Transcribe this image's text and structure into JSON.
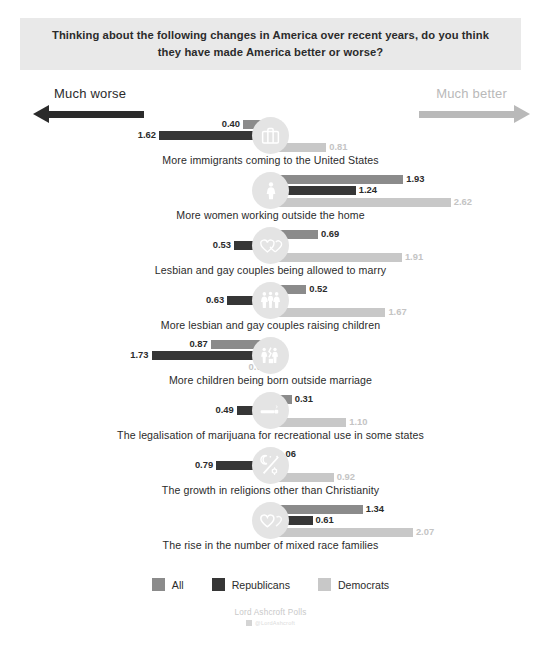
{
  "title": "Thinking about the following changes in America over recent years, do you think they have made America better or worse?",
  "direction": {
    "worse_label": "Much worse",
    "better_label": "Much better",
    "worse_arrow_icon": "arrow-left-icon",
    "better_arrow_icon": "arrow-right-icon"
  },
  "legend": {
    "items": [
      {
        "label": "All",
        "color": "#8b8b8b"
      },
      {
        "label": "Republicans",
        "color": "#363636"
      },
      {
        "label": "Democrats",
        "color": "#c8c8c8"
      }
    ]
  },
  "footer": {
    "source": "Lord Ashcroft Polls",
    "handle": "@LordAshcroft",
    "handle_icon": "twitter-icon"
  },
  "chart_data": {
    "type": "bar",
    "orientation": "horizontal-diverging",
    "title": "Thinking about the following changes in America over recent years, do you think they have made America better or worse?",
    "xlabel": "",
    "ylabel": "",
    "axis_left_label": "Much worse",
    "axis_right_label": "Much better",
    "grid": false,
    "legend_position": "bottom",
    "units_per_pixel_note": "values plotted as signed distance from centre; negative = worse (left), positive = better (right)",
    "xlim": [
      -2.7,
      2.7
    ],
    "categories": [
      "More immigrants coming to the United States",
      "More women working outside the home",
      "Lesbian and gay couples being allowed to marry",
      "More lesbian and gay couples raising children",
      "More children being born outside marriage",
      "The legalisation of marijuana for recreational use in some states",
      "The growth in religions other than Christianity",
      "The rise in the number of mixed race families"
    ],
    "icons": [
      "suitcase-icon",
      "woman-icon",
      "two-hearts-icon",
      "family-icon",
      "broken-family-icon",
      "cannabis-icon",
      "religions-icon",
      "heart-icon"
    ],
    "series": [
      {
        "name": "All",
        "color": "#8b8b8b",
        "values": [
          -0.4,
          1.93,
          0.69,
          0.52,
          -0.87,
          0.31,
          0.06,
          1.34
        ],
        "labels": [
          "0.40",
          "1.93",
          "0.69",
          "0.52",
          "0.87",
          "0.31",
          "0.06",
          "1.34"
        ]
      },
      {
        "name": "Republicans",
        "color": "#363636",
        "values": [
          -1.62,
          1.24,
          -0.53,
          -0.63,
          -1.73,
          -0.49,
          -0.79,
          0.61
        ],
        "labels": [
          "1.62",
          "1.24",
          "0.53",
          "0.63",
          "1.73",
          "0.49",
          "0.79",
          "0.61"
        ]
      },
      {
        "name": "Democrats",
        "color": "#c8c8c8",
        "values": [
          0.81,
          2.62,
          1.91,
          1.67,
          -0.01,
          1.1,
          0.92,
          2.07
        ],
        "labels": [
          "0.81",
          "2.62",
          "1.91",
          "1.67",
          "0.01",
          "1.10",
          "0.92",
          "2.07"
        ]
      }
    ]
  }
}
